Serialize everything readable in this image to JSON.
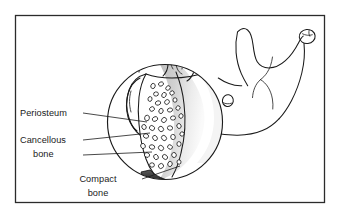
{
  "figure": {
    "background_color": "#ffffff",
    "frame": {
      "name": "figure-border",
      "color": "#2b2b2b",
      "x": 15,
      "y": 15,
      "width": 310,
      "height": 188
    }
  },
  "colors": {
    "ink": "#1a1a1a",
    "line": "#2a2a2a",
    "shading_gray": "#c9c9c9",
    "shading_gray_light": "#e2e2e2",
    "compact_dark": "#141414",
    "paper": "#ffffff"
  },
  "labels": [
    {
      "id": "periosteum",
      "name": "label-periosteum",
      "lines": [
        "Periosteum"
      ],
      "align": "left",
      "text_x": 20,
      "text_y": 116,
      "leader": {
        "x1": 83,
        "y1": 113,
        "x2": 147,
        "y2": 122
      }
    },
    {
      "id": "cancellous-bone",
      "name": "label-cancellous-bone",
      "lines": [
        "Cancellous",
        "bone"
      ],
      "align": "left",
      "text_x": 20,
      "text_y": 143,
      "leader": {
        "x1": 83,
        "y1": 140,
        "x2": 150,
        "y2": 133
      },
      "leader2": {
        "x1": 83,
        "y1": 155,
        "x2": 150,
        "y2": 152
      }
    },
    {
      "id": "compact-bone",
      "name": "label-compact-bone",
      "lines": [
        "Compact",
        "bone"
      ],
      "align": "center",
      "text_x": 98,
      "text_y": 182,
      "leader": {
        "x1": 142,
        "y1": 179,
        "x2": 178,
        "y2": 166
      }
    }
  ],
  "magnifier": {
    "name": "magnified-circle-inset",
    "center_x": 165,
    "center_y": 122,
    "radius": 58,
    "contents": [
      "molar-teeth",
      "periosteum-layer",
      "cancellous-bone-trabeculae",
      "compact-bone-cortex",
      "marrow-shading"
    ]
  },
  "anatomy": {
    "name": "mandible-outline",
    "parts": [
      "condyle",
      "coronoid-process",
      "mandibular-ramus",
      "mandibular-body",
      "mandibular-angle",
      "alveolar-ridge"
    ]
  }
}
